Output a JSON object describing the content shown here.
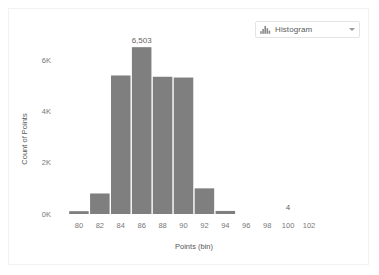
{
  "selector": {
    "label": "Histogram",
    "icon": "histogram-icon",
    "caret_icon": "chevron-down-icon"
  },
  "chart_data": {
    "type": "bar",
    "title": "",
    "subtitle": "",
    "xlabel": "Points (bin)",
    "ylabel": "Count of Points",
    "grid": false,
    "legend": null,
    "bar_color": "#7f7f7f",
    "xlim": [
      79,
      103
    ],
    "ylim": [
      0,
      6900
    ],
    "xticks": [
      "80",
      "82",
      "84",
      "86",
      "88",
      "90",
      "92",
      "94",
      "96",
      "98",
      "100",
      "102"
    ],
    "xtick_values": [
      80,
      82,
      84,
      86,
      88,
      90,
      92,
      94,
      96,
      98,
      100,
      102
    ],
    "yticks": [
      "0K",
      "2K",
      "4K",
      "6K"
    ],
    "ytick_values": [
      0,
      2000,
      4000,
      6000
    ],
    "bin_width": 2,
    "categories": [
      "80",
      "82",
      "84",
      "86",
      "88",
      "90",
      "92",
      "94",
      "96"
    ],
    "bin_starts": [
      80,
      82,
      84,
      86,
      88,
      90,
      92,
      94,
      96
    ],
    "values": [
      110,
      800,
      5400,
      6503,
      5350,
      5320,
      1000,
      120,
      0
    ],
    "annotations": [
      {
        "text": "6,503",
        "bin_start": 86,
        "value": 6503,
        "position": "above-bar"
      },
      {
        "text": "4",
        "bin_start": 100,
        "value": 4,
        "position": "above-bar"
      }
    ]
  }
}
